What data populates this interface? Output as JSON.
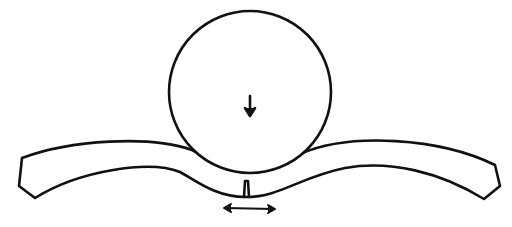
{
  "diagram": {
    "stroke_color": "#111111",
    "background": "#ffffff",
    "elements": [
      {
        "name": "roller",
        "shape": "circle"
      },
      {
        "name": "load-arrow",
        "direction": "down"
      },
      {
        "name": "curved-beam",
        "shape": "bent strip"
      },
      {
        "name": "crack",
        "location": "beam underside center"
      },
      {
        "name": "tension-arrow",
        "direction": "left-right"
      }
    ]
  }
}
